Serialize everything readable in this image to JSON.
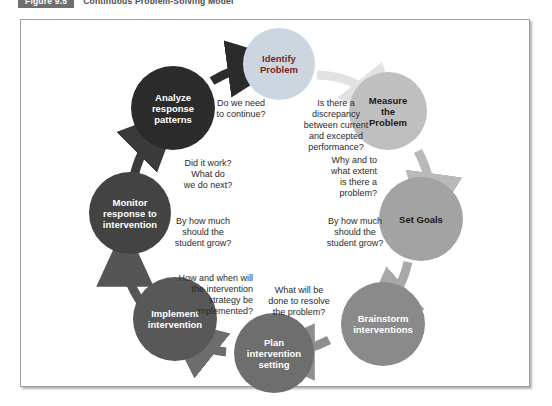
{
  "caption": {
    "figure_tag": "Figure 9.5",
    "title": "Continuous Problem-Solving Model"
  },
  "diagram": {
    "type": "cycle",
    "nodes": [
      {
        "id": "identify-problem",
        "label": "Identify\nProblem",
        "fill": "#ccd6e0",
        "text_color": "#7b1f22"
      },
      {
        "id": "measure-problem",
        "label": "Measure\nthe\nProblem",
        "fill": "#bfbfbf",
        "text_color": "#1a1a1a"
      },
      {
        "id": "set-goals",
        "label": "Set Goals",
        "fill": "#a3a3a3",
        "text_color": "#1a1a1a"
      },
      {
        "id": "brainstorm-interventions",
        "label": "Brainstorm\ninterventions",
        "fill": "#8a8a8a",
        "text_color": "#ffffff"
      },
      {
        "id": "plan-intervention-setting",
        "label": "Plan\nintervention\nsetting",
        "fill": "#6e6e6e",
        "text_color": "#ffffff"
      },
      {
        "id": "implement-intervention",
        "label": "Implement\nintervention",
        "fill": "#585858",
        "text_color": "#ffffff"
      },
      {
        "id": "monitor-response",
        "label": "Monitor\nresponse to\nintervention",
        "fill": "#434343",
        "text_color": "#ffffff"
      },
      {
        "id": "analyze-response-patterns",
        "label": "Analyze\nresponse\npatterns",
        "fill": "#2b2b2b",
        "text_color": "#ffffff"
      }
    ],
    "labels": [
      {
        "id": "label-do-we-need-to-continue",
        "text": "Do we need\nto continue?"
      },
      {
        "id": "label-is-there-a-discrepancy",
        "text": "Is there a\ndiscrepancy\nbetween current\nand excepted\nperformance?"
      },
      {
        "id": "label-why-and-to-what-extent",
        "text": "Why and to\nwhat extent\nis there a\nproblem?"
      },
      {
        "id": "label-grow-right",
        "text": "By how much\nshould the\nstudent grow?"
      },
      {
        "id": "label-what-will-be-done",
        "text": "What will be\ndone to resolve\nthe problem?"
      },
      {
        "id": "label-how-and-when",
        "text": "How and when will\nthe intervention\nstrategy be\nimplemented?"
      },
      {
        "id": "label-grow-left",
        "text": "By how much\nshould the\nstudent grow?"
      },
      {
        "id": "label-did-it-work",
        "text": "Did it work?\nWhat do\nwe do next?"
      }
    ]
  },
  "colors": {
    "frame_border": "#9d9d9d",
    "arrow_light": "#e2e2e2",
    "arrow_mid": "#b9b9b9",
    "arrow_dark": "#6d6d6d",
    "arrow_darkest": "#3a3a3a",
    "caption_tag_bg": "#6f6f6f"
  }
}
